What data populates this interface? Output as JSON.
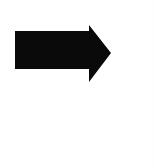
{
  "canvas": {
    "width": 154,
    "height": 168,
    "background_color": "#ffffff",
    "description": "Plain white square canvas containing a single solid black right-pointing arrow glyph in the upper half"
  },
  "graphic": {
    "name": "right-arrow",
    "kind": "arrow",
    "direction": "right",
    "fill_color": "#0a0a0a",
    "stroke": "none",
    "shaft": {
      "x": 15,
      "y": 31,
      "width": 74,
      "height": 38
    },
    "head": {
      "base_x": 89,
      "base_top_y": 25,
      "base_bottom_y": 82,
      "tip_x": 111,
      "tip_y": 53
    },
    "bounding_box": {
      "x": 15,
      "y": 25,
      "width": 96,
      "height": 57
    },
    "polygon_points": "15,31 89,31 89,25 111,53 89,82 89,69 15,69"
  }
}
